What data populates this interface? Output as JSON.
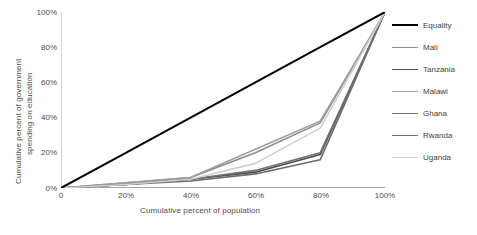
{
  "chart_data": {
    "type": "line",
    "title": "",
    "xlabel": "Cumulative percent of population",
    "ylabel": "Cumulative percent of government spending on education",
    "xlim": [
      0,
      100
    ],
    "ylim": [
      0,
      100
    ],
    "xticks": [
      "0",
      "20%",
      "40%",
      "60%",
      "80%",
      "100%"
    ],
    "yticks": [
      "0%",
      "20%",
      "40%",
      "60%",
      "80%",
      "100%"
    ],
    "grid": false,
    "legend_position": "right",
    "x": [
      0,
      20,
      40,
      60,
      80,
      100
    ],
    "series": [
      {
        "name": "Equality",
        "color": "#000000",
        "width": 2.0,
        "values": [
          0,
          20,
          40,
          60,
          80,
          100
        ]
      },
      {
        "name": "Mali",
        "color": "#8c8c8c",
        "width": 1.6,
        "values": [
          0,
          3,
          6,
          20,
          37,
          100
        ]
      },
      {
        "name": "Tanzania",
        "color": "#4a4a4a",
        "width": 1.6,
        "values": [
          0,
          2,
          5,
          9,
          19,
          100
        ]
      },
      {
        "name": "Malawi",
        "color": "#9e9e9e",
        "width": 1.6,
        "values": [
          0,
          3,
          6,
          22,
          38,
          100
        ]
      },
      {
        "name": "Ghana",
        "color": "#6b6b6b",
        "width": 1.6,
        "values": [
          0,
          2,
          4,
          8,
          16,
          100
        ]
      },
      {
        "name": "Rwanda",
        "color": "#707070",
        "width": 1.6,
        "values": [
          0,
          2,
          5,
          10,
          20,
          100
        ]
      },
      {
        "name": "Uganda",
        "color": "#cfcfcf",
        "width": 1.6,
        "values": [
          0,
          2,
          5,
          14,
          34,
          100
        ]
      }
    ]
  },
  "axes": {
    "y_title_line1": "Cumulative percent of government",
    "y_title_line2": "spending on education",
    "x_title": "Cumulative percent of population"
  },
  "legend": {
    "items": [
      {
        "label": "Equality"
      },
      {
        "label": "Mali"
      },
      {
        "label": "Tanzania"
      },
      {
        "label": "Malawi"
      },
      {
        "label": "Ghana"
      },
      {
        "label": "Rwanda"
      },
      {
        "label": "Uganda"
      }
    ]
  }
}
